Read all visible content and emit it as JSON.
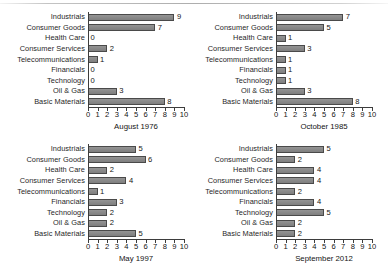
{
  "figure": {
    "background_color": "#ffffff",
    "bar_fill_color": "#8b8b8b",
    "bar_border_color": "#4a4a4a",
    "axis_color": "#3d3d3d"
  },
  "chart_data": [
    {
      "type": "bar",
      "orientation": "horizontal",
      "title": "August 1976",
      "xlabel": "",
      "ylabel": "",
      "xlim": [
        0,
        10
      ],
      "grid": false,
      "legend": "none",
      "xticks": [
        "0",
        "1",
        "2",
        "3",
        "4",
        "5",
        "6",
        "7",
        "8",
        "9",
        "10"
      ],
      "categories": [
        "Industrials",
        "Consumer Goods",
        "Health Care",
        "Consumer Services",
        "Telecommunications",
        "Financials",
        "Technology",
        "Oil & Gas",
        "Basic Materials"
      ],
      "values": [
        9,
        7,
        0,
        2,
        1,
        0,
        0,
        3,
        8
      ],
      "value_labels": [
        "9",
        "7",
        "0",
        "2",
        "1",
        "0",
        "0",
        "3",
        "8"
      ]
    },
    {
      "type": "bar",
      "orientation": "horizontal",
      "title": "October 1985",
      "xlabel": "",
      "ylabel": "",
      "xlim": [
        0,
        10
      ],
      "grid": false,
      "legend": "none",
      "xticks": [
        "0",
        "1",
        "2",
        "3",
        "4",
        "5",
        "6",
        "7",
        "8",
        "9",
        "10"
      ],
      "categories": [
        "Industrials",
        "Consumer Goods",
        "Health Care",
        "Consumer Services",
        "Telecommunications",
        "Financials",
        "Technology",
        "Oil & Gas",
        "Basic Materials"
      ],
      "values": [
        7,
        5,
        1,
        3,
        1,
        1,
        1,
        3,
        8
      ],
      "value_labels": [
        "7",
        "5",
        "1",
        "3",
        "1",
        "1",
        "1",
        "3",
        "8"
      ]
    },
    {
      "type": "bar",
      "orientation": "horizontal",
      "title": "May 1997",
      "xlabel": "",
      "ylabel": "",
      "xlim": [
        0,
        10
      ],
      "grid": false,
      "legend": "none",
      "xticks": [
        "0",
        "1",
        "2",
        "3",
        "4",
        "5",
        "6",
        "7",
        "8",
        "9",
        "10"
      ],
      "categories": [
        "Industrials",
        "Consumer Goods",
        "Health Care",
        "Consumer Services",
        "Telecommunications",
        "Financials",
        "Technology",
        "Oil & Gas",
        "Basic Materials"
      ],
      "values": [
        5,
        6,
        2,
        4,
        1,
        3,
        2,
        2,
        5
      ],
      "value_labels": [
        "5",
        "6",
        "2",
        "4",
        "1",
        "3",
        "2",
        "2",
        "5"
      ]
    },
    {
      "type": "bar",
      "orientation": "horizontal",
      "title": "September 2012",
      "xlabel": "",
      "ylabel": "",
      "xlim": [
        0,
        10
      ],
      "grid": false,
      "legend": "none",
      "xticks": [
        "0",
        "1",
        "2",
        "3",
        "4",
        "5",
        "6",
        "7",
        "8",
        "9",
        "10"
      ],
      "categories": [
        "Industrials",
        "Consumer Goods",
        "Health Care",
        "Consumer Services",
        "Telecommunications",
        "Financials",
        "Technology",
        "Oil & Gas",
        "Basic Materials"
      ],
      "values": [
        5,
        2,
        4,
        4,
        2,
        4,
        5,
        2,
        2
      ],
      "value_labels": [
        "5",
        "2",
        "4",
        "4",
        "2",
        "4",
        "5",
        "2",
        "2"
      ]
    }
  ]
}
